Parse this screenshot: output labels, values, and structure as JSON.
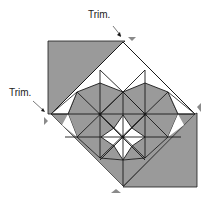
{
  "diagram": {
    "type": "quilt-block-trim-diagram",
    "labels": {
      "trim_top": "Trim.",
      "trim_left": "Trim."
    },
    "colors": {
      "fill_gray": "#9a9a9a",
      "fill_white": "#ffffff",
      "line": "#1a1a1a",
      "marker": "#8a8a8a"
    },
    "markers": [
      "top-trim-marker",
      "left-trim-marker",
      "right-trim-marker",
      "bottom-trim-marker"
    ]
  }
}
